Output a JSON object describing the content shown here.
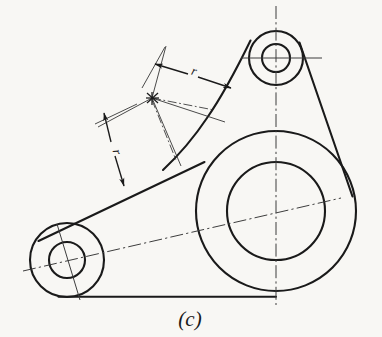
{
  "figure": {
    "caption": "(c)",
    "background_color": "#f8f7f4",
    "line_color": "#1a1a1a",
    "centerline_color": "#4a4a4a"
  },
  "labels": {
    "radius_upper": "r",
    "radius_lower": "r"
  },
  "bosses": [
    {
      "name": "top-boss",
      "cx": 276,
      "cy": 58,
      "outer_r": 27,
      "inner_r": 14
    },
    {
      "name": "center-boss",
      "cx": 276,
      "cy": 211,
      "outer_r": 80,
      "inner_r": 49
    },
    {
      "name": "left-boss",
      "cx": 67,
      "cy": 260,
      "outer_r": 37,
      "inner_r": 18
    }
  ],
  "centerlines": [
    {
      "name": "vertical-centerline",
      "x1": 276,
      "y1": 6,
      "x2": 276,
      "y2": 305
    },
    {
      "name": "top-boss-horizontal-centerline",
      "x1": 241,
      "y1": 58,
      "x2": 322,
      "y2": 58
    },
    {
      "name": "inclined-centerline",
      "x1": 23,
      "y1": 271,
      "x2": 341,
      "y2": 198
    }
  ],
  "dimensions": [
    {
      "name": "upper-radius-dimension",
      "label": "r",
      "from_x": 154,
      "from_y": 97,
      "to_x": 227,
      "to_y": 84,
      "label_x": 196,
      "label_y": 70
    },
    {
      "name": "lower-radius-dimension",
      "label": "r",
      "from_x": 152,
      "from_y": 100,
      "to_x": 122,
      "to_y": 173,
      "label_x": 117,
      "label_y": 152
    }
  ],
  "center_mark": {
    "name": "radius-center-mark",
    "x": 152,
    "y": 98
  }
}
